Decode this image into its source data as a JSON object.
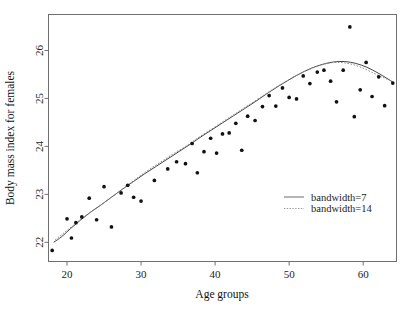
{
  "chart_data": {
    "type": "scatter",
    "title": "",
    "xlabel": "Age groups",
    "ylabel": "Body mass index for females",
    "xlim": [
      17.5,
      64.5
    ],
    "ylim": [
      21.6,
      26.75
    ],
    "xticks": [
      20,
      30,
      40,
      50,
      60
    ],
    "yticks": [
      22,
      23,
      24,
      25,
      26
    ],
    "xtick_labels": [
      "20",
      "30",
      "40",
      "50",
      "60"
    ],
    "ytick_labels": [
      "22",
      "23",
      "24",
      "25",
      "26"
    ],
    "grid": false,
    "legend_position": "center-right",
    "legend": [
      {
        "label": "bandwidth=7",
        "style": "solid"
      },
      {
        "label": "bandwidth=14",
        "style": "dotted"
      }
    ],
    "points": [
      {
        "x": 18,
        "y": 21.83
      },
      {
        "x": 20,
        "y": 22.49
      },
      {
        "x": 20.6,
        "y": 22.09
      },
      {
        "x": 21.2,
        "y": 22.41
      },
      {
        "x": 22,
        "y": 22.53
      },
      {
        "x": 23,
        "y": 22.92
      },
      {
        "x": 24,
        "y": 22.47
      },
      {
        "x": 25,
        "y": 23.16
      },
      {
        "x": 26,
        "y": 22.32
      },
      {
        "x": 27.3,
        "y": 23.03
      },
      {
        "x": 28.2,
        "y": 23.19
      },
      {
        "x": 29,
        "y": 22.94
      },
      {
        "x": 30,
        "y": 22.86
      },
      {
        "x": 31.8,
        "y": 23.29
      },
      {
        "x": 33.6,
        "y": 23.53
      },
      {
        "x": 34.8,
        "y": 23.68
      },
      {
        "x": 36,
        "y": 23.64
      },
      {
        "x": 36.9,
        "y": 24.06
      },
      {
        "x": 37.6,
        "y": 23.45
      },
      {
        "x": 38.5,
        "y": 23.89
      },
      {
        "x": 39.4,
        "y": 24.17
      },
      {
        "x": 40.2,
        "y": 23.86
      },
      {
        "x": 41,
        "y": 24.26
      },
      {
        "x": 41.9,
        "y": 24.28
      },
      {
        "x": 42.8,
        "y": 24.48
      },
      {
        "x": 43.6,
        "y": 23.92
      },
      {
        "x": 44.4,
        "y": 24.63
      },
      {
        "x": 45.4,
        "y": 24.54
      },
      {
        "x": 46.4,
        "y": 24.83
      },
      {
        "x": 47.3,
        "y": 25.06
      },
      {
        "x": 48.2,
        "y": 24.84
      },
      {
        "x": 49.1,
        "y": 25.22
      },
      {
        "x": 50,
        "y": 25.02
      },
      {
        "x": 51,
        "y": 24.99
      },
      {
        "x": 51.9,
        "y": 25.47
      },
      {
        "x": 52.8,
        "y": 25.31
      },
      {
        "x": 53.8,
        "y": 25.55
      },
      {
        "x": 54.7,
        "y": 25.59
      },
      {
        "x": 55.6,
        "y": 25.36
      },
      {
        "x": 56.4,
        "y": 24.93
      },
      {
        "x": 57.3,
        "y": 25.59
      },
      {
        "x": 58.2,
        "y": 26.49
      },
      {
        "x": 58.8,
        "y": 24.62
      },
      {
        "x": 59.6,
        "y": 25.18
      },
      {
        "x": 60.4,
        "y": 25.75
      },
      {
        "x": 61.2,
        "y": 25.04
      },
      {
        "x": 62.1,
        "y": 25.45
      },
      {
        "x": 62.9,
        "y": 24.85
      },
      {
        "x": 64,
        "y": 25.32
      }
    ],
    "series": [
      {
        "name": "bandwidth=7",
        "style": "solid",
        "x": [
          18.2,
          19.3,
          20.5,
          21.8,
          23.1,
          24.5,
          26,
          27.5,
          29,
          30.5,
          32,
          33.5,
          35,
          36.5,
          38,
          39.5,
          41,
          42.5,
          44,
          45.5,
          47,
          48.5,
          50,
          51.5,
          53,
          54.5,
          56,
          57.5,
          59,
          60.5,
          62,
          63.2,
          64.1
        ],
        "y": [
          22.0,
          22.12,
          22.29,
          22.46,
          22.62,
          22.77,
          22.94,
          23.11,
          23.27,
          23.43,
          23.58,
          23.73,
          23.88,
          24.03,
          24.19,
          24.34,
          24.49,
          24.64,
          24.79,
          24.94,
          25.1,
          25.25,
          25.39,
          25.52,
          25.63,
          25.71,
          25.76,
          25.77,
          25.73,
          25.65,
          25.53,
          25.42,
          25.33
        ]
      },
      {
        "name": "bandwidth=14",
        "style": "dotted",
        "x": [
          18.4,
          19.6,
          20.9,
          22.2,
          23.5,
          24.8,
          26.1,
          27.4,
          28.7,
          30,
          31.5,
          33,
          34.5,
          36,
          37.5,
          39,
          40.5,
          42,
          43.5,
          45,
          46.5,
          48,
          49.5,
          51,
          52.5,
          54,
          55.5,
          57,
          58.5,
          60,
          61.5,
          62.8,
          64.0
        ],
        "y": [
          22.05,
          22.2,
          22.36,
          22.52,
          22.66,
          22.8,
          22.95,
          23.1,
          23.25,
          23.4,
          23.56,
          23.71,
          23.86,
          24.0,
          24.16,
          24.31,
          24.46,
          24.61,
          24.76,
          24.91,
          25.06,
          25.21,
          25.35,
          25.48,
          25.59,
          25.68,
          25.74,
          25.75,
          25.71,
          25.63,
          25.52,
          25.43,
          25.35
        ]
      }
    ]
  }
}
